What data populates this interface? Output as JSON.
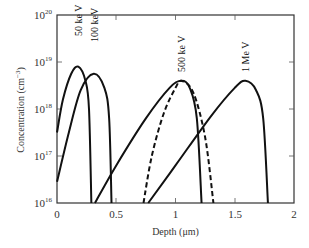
{
  "chart_data": {
    "type": "line",
    "title": "",
    "xlabel": "Depth (μm)",
    "ylabel": "Concentration (cm⁻³)",
    "xlim": [
      0,
      2
    ],
    "ylim": [
      1e+16,
      1e+20
    ],
    "yscale": "log",
    "grid": false,
    "legend": "inline labels at curve peaks",
    "x_ticks": [
      {
        "value": 0,
        "label": "0"
      },
      {
        "value": 0.5,
        "label": "0.5"
      },
      {
        "value": 1,
        "label": "1"
      },
      {
        "value": 1.5,
        "label": "1.5"
      },
      {
        "value": 2,
        "label": "2"
      }
    ],
    "y_ticks": [
      {
        "exp": 16,
        "base": "10",
        "sup": "16"
      },
      {
        "exp": 17,
        "base": "10",
        "sup": "17"
      },
      {
        "exp": 18,
        "base": "10",
        "sup": "18"
      },
      {
        "exp": 19,
        "base": "10",
        "sup": "19"
      },
      {
        "exp": 20,
        "base": "10",
        "sup": "20"
      }
    ],
    "series": [
      {
        "name": "50 ke V",
        "style": "solid",
        "points_log10": [
          [
            0.0,
            17.5
          ],
          [
            0.05,
            18.2
          ],
          [
            0.12,
            18.75
          ],
          [
            0.18,
            18.9
          ],
          [
            0.24,
            18.6
          ],
          [
            0.27,
            18.0
          ],
          [
            0.29,
            16.0
          ]
        ]
      },
      {
        "name": "100 keV",
        "style": "solid",
        "points_log10": [
          [
            0.0,
            16.45
          ],
          [
            0.1,
            17.5
          ],
          [
            0.2,
            18.4
          ],
          [
            0.31,
            18.75
          ],
          [
            0.4,
            18.45
          ],
          [
            0.44,
            17.8
          ],
          [
            0.46,
            16.0
          ]
        ]
      },
      {
        "name": "500 ke V",
        "style": "solid",
        "points_log10": [
          [
            0.32,
            16.0
          ],
          [
            0.5,
            16.8
          ],
          [
            0.75,
            17.8
          ],
          [
            0.95,
            18.45
          ],
          [
            1.05,
            18.6
          ],
          [
            1.12,
            18.45
          ],
          [
            1.18,
            17.8
          ],
          [
            1.22,
            16.0
          ]
        ]
      },
      {
        "name": "500 keV (dashed)",
        "style": "dashed",
        "points_log10": [
          [
            0.73,
            16.0
          ],
          [
            0.8,
            17.0
          ],
          [
            0.9,
            17.9
          ],
          [
            1.0,
            18.45
          ],
          [
            1.05,
            18.6
          ],
          [
            1.15,
            18.35
          ],
          [
            1.25,
            17.4
          ],
          [
            1.32,
            16.0
          ]
        ]
      },
      {
        "name": "1 Me V",
        "style": "solid",
        "points_log10": [
          [
            0.77,
            16.0
          ],
          [
            1.0,
            16.8
          ],
          [
            1.3,
            17.85
          ],
          [
            1.5,
            18.45
          ],
          [
            1.59,
            18.6
          ],
          [
            1.68,
            18.4
          ],
          [
            1.74,
            17.8
          ],
          [
            1.78,
            16.0
          ]
        ]
      }
    ],
    "annotations": [
      {
        "text": "50 ke V",
        "x": 0.18,
        "rotated": true
      },
      {
        "text": "100 keV",
        "x": 0.31,
        "rotated": true
      },
      {
        "text": "500 ke V",
        "x": 1.05,
        "rotated": true
      },
      {
        "text": "1 Me V",
        "x": 1.59,
        "rotated": true
      }
    ]
  },
  "labels": {
    "xlabel": "Depth (μm)",
    "ylabel_main": "Concentration (cm",
    "ylabel_sup": "−3",
    "ylabel_close": ")",
    "x0": "0",
    "x05": "0.5",
    "x1": "1",
    "x15": "1.5",
    "x2": "2",
    "ybase": "10",
    "y16": "16",
    "y17": "17",
    "y18": "18",
    "y19": "19",
    "y20": "20",
    "c50": "50 ke V",
    "c100": "100 keV",
    "c500": "500 ke V",
    "c1m": "1 Me V"
  }
}
